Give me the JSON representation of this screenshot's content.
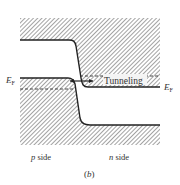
{
  "diagram": {
    "type": "band-diagram",
    "labels": {
      "ef_left_main": "E",
      "ef_left_sub": "F",
      "ef_right_main": "E",
      "ef_right_sub": "F",
      "tunneling": "Tunneling",
      "p_side": "p side",
      "p_side_italic": "p",
      "p_side_rest": " side",
      "n_side_italic": "n",
      "n_side_rest": " side",
      "panel_label_open": "(",
      "panel_label_letter": "b",
      "panel_label_close": ")"
    },
    "colors": {
      "hatch": "#555555",
      "line": "#222222",
      "text": "#333333",
      "background": "#ffffff"
    }
  }
}
